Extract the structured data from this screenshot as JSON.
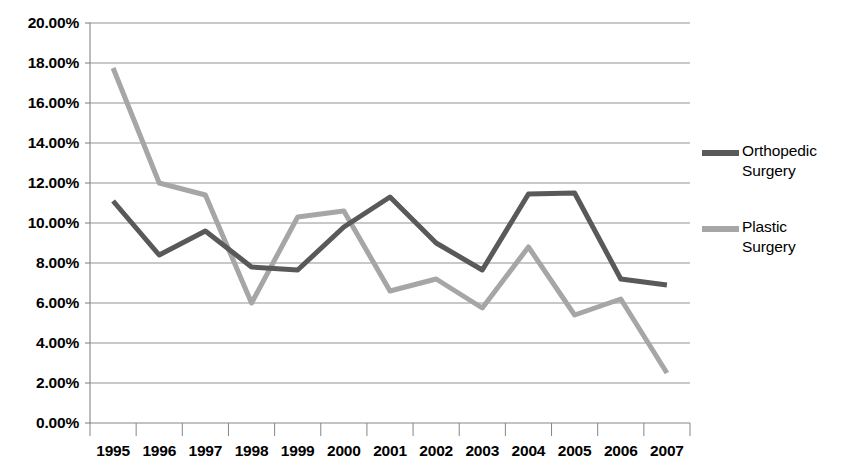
{
  "chart_data": {
    "type": "line",
    "title": "",
    "subtitle": "",
    "xlabel": "",
    "ylabel": "",
    "categories": [
      "1995",
      "1996",
      "1997",
      "1998",
      "1999",
      "2000",
      "2001",
      "2002",
      "2003",
      "2004",
      "2005",
      "2006",
      "2007"
    ],
    "y_tick_labels": [
      "0.00%",
      "2.00%",
      "4.00%",
      "6.00%",
      "8.00%",
      "10.00%",
      "12.00%",
      "14.00%",
      "16.00%",
      "18.00%",
      "20.00%"
    ],
    "y_tick_values": [
      0,
      2,
      4,
      6,
      8,
      10,
      12,
      14,
      16,
      18,
      20
    ],
    "ylim": [
      0,
      20
    ],
    "y_unit": "%",
    "grid": "horizontal",
    "legend_position": "right",
    "series": [
      {
        "name": "Orthopedic Surgery",
        "color": "#595959",
        "values": [
          11.1,
          8.4,
          9.6,
          7.8,
          7.65,
          9.8,
          11.3,
          9.0,
          7.65,
          11.45,
          11.5,
          7.2,
          6.9
        ]
      },
      {
        "name": "Plastic Surgery",
        "color": "#a6a6a6",
        "values": [
          17.75,
          12.0,
          11.4,
          6.0,
          10.3,
          10.6,
          6.6,
          7.2,
          5.75,
          8.8,
          5.4,
          6.2,
          2.5
        ]
      }
    ]
  },
  "legend": {
    "entries": [
      {
        "label": "Orthopedic\nSurgery",
        "color": "#595959"
      },
      {
        "label": "Plastic\nSurgery",
        "color": "#a6a6a6"
      }
    ]
  },
  "axes": {
    "gridline_color": "#868686",
    "axis_color": "#868686"
  }
}
